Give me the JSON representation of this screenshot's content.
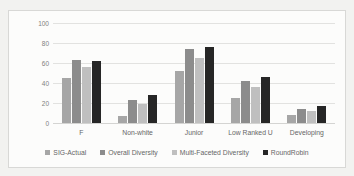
{
  "chart_data": {
    "type": "bar",
    "title": "",
    "xlabel": "",
    "ylabel": "Authors Percent",
    "ylim": [
      0,
      100
    ],
    "yticks": [
      "0",
      "20",
      "40",
      "60",
      "80",
      "100"
    ],
    "grid": true,
    "legend_position": "bottom",
    "categories": [
      "F",
      "Non-white",
      "Junior",
      "Low Ranked U",
      "Developing"
    ],
    "series": [
      {
        "name": "SIG-Actual",
        "color": "#a6a6a6",
        "values": [
          45,
          7,
          52,
          25,
          8
        ]
      },
      {
        "name": "Overall Diversity",
        "color": "#8c8c8c",
        "values": [
          63,
          23,
          74,
          42,
          14
        ]
      },
      {
        "name": "Multi-Faceted Diversity",
        "color": "#bfbfbf",
        "values": [
          56,
          19,
          65,
          36,
          12
        ]
      },
      {
        "name": "RoundRobin",
        "color": "#262626",
        "values": [
          62,
          28,
          76,
          46,
          17
        ]
      }
    ]
  }
}
